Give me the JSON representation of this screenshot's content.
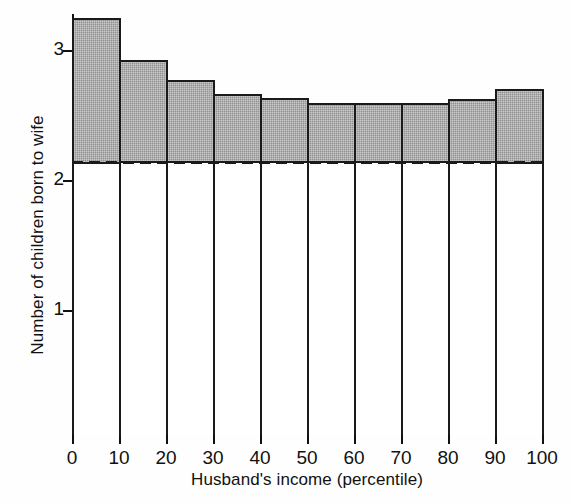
{
  "chart_data": {
    "type": "bar",
    "title": "",
    "xlabel": "Husband's income (percentile)",
    "ylabel": "Number of children born to wife",
    "categories": [
      "0-10",
      "10-20",
      "20-30",
      "30-40",
      "40-50",
      "50-60",
      "60-70",
      "70-80",
      "80-90",
      "90-100"
    ],
    "bin_edges": [
      0,
      10,
      20,
      30,
      40,
      50,
      60,
      70,
      80,
      90,
      100
    ],
    "values": [
      3.25,
      2.92,
      2.77,
      2.66,
      2.63,
      2.59,
      2.59,
      2.59,
      2.62,
      2.7
    ],
    "xlim": [
      0,
      100
    ],
    "ylim": [
      0,
      3.36
    ],
    "xticks": [
      0,
      10,
      20,
      30,
      40,
      50,
      60,
      70,
      80,
      90,
      100
    ],
    "xtick_labels": [
      "0",
      "10",
      "20",
      "30",
      "40",
      "50",
      "60",
      "70",
      "80",
      "90",
      "100"
    ],
    "yticks": [
      1,
      2,
      3
    ],
    "ytick_labels": [
      "1",
      "2",
      "3"
    ],
    "grid": false,
    "legend": "none",
    "annotations": [
      {
        "name": "reference-line",
        "kind": "horizontal-dashed-line",
        "value": 2.15,
        "style": "dashed",
        "color": "#1a1a1a"
      }
    ],
    "bar_style": {
      "fill_above_reference": "#9a9a9a",
      "fill_below_reference": "#ffffff",
      "edge_color": "#1a1a1a"
    }
  },
  "colors": {
    "background": "#ffffff",
    "axis": "#111111",
    "bar_fill": "#9a9a9a",
    "bar_edge": "#1a1a1a",
    "reference_line": "#1a1a1a",
    "text": "#111111"
  }
}
